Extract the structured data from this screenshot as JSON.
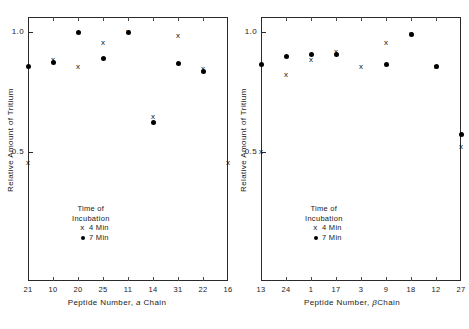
{
  "chart_data": [
    {
      "type": "scatter",
      "title": "",
      "panel_id": "alpha",
      "xlabel": "Peptide Number, a Chain",
      "xlabel_parts": {
        "prefix": "Peptide  Number, ",
        "italic": "a",
        "suffix": " Chain"
      },
      "ylabel": "Relative Amount of Tritium",
      "categories": [
        "21",
        "10",
        "20",
        "25",
        "11",
        "14",
        "31",
        "22",
        "16"
      ],
      "ylim": [
        0.44,
        1.04
      ],
      "yticks": [
        1.0,
        0.5
      ],
      "ytick_labels": [
        "1.0",
        "0.5"
      ],
      "grid": false,
      "legend_position": "lower-center",
      "series": [
        {
          "name": "4 Min",
          "marker": "x",
          "values": [
            0.455,
            0.885,
            0.855,
            0.955,
            1.0,
            0.645,
            0.985,
            0.845,
            0.455
          ]
        },
        {
          "name": "7 Min",
          "marker": "dot",
          "values": [
            0.855,
            0.875,
            1.0,
            0.89,
            1.0,
            0.625,
            0.87,
            0.835,
            null
          ]
        }
      ]
    },
    {
      "type": "scatter",
      "title": "",
      "panel_id": "beta",
      "xlabel": "Peptide Number, β Chain",
      "xlabel_parts": {
        "prefix": "Peptide  Number, ",
        "italic": "β",
        "suffix": "Chain"
      },
      "ylabel": "Relative Amount of Tritium",
      "categories": [
        "13",
        "24",
        "1",
        "17",
        "3",
        "9",
        "18",
        "12",
        "27"
      ],
      "ylim": [
        0.44,
        1.04
      ],
      "yticks": [
        1.0,
        0.5
      ],
      "ytick_labels": [
        "1.0",
        "0.5"
      ],
      "grid": false,
      "legend_position": "lower-center",
      "series": [
        {
          "name": "4 Min",
          "marker": "x",
          "values": [
            0.5,
            0.82,
            0.885,
            0.915,
            0.855,
            0.955,
            0.99,
            0.855,
            0.52
          ]
        },
        {
          "name": "7 Min",
          "marker": "dot",
          "values": [
            0.865,
            0.9,
            0.905,
            0.905,
            null,
            0.865,
            0.99,
            0.855,
            0.575
          ]
        }
      ]
    }
  ],
  "panels": {
    "alpha": {
      "legend": {
        "title_line1": "Time of",
        "title_line2": "Incubation",
        "entries": [
          {
            "symbol": "x",
            "label": "4 Min"
          },
          {
            "symbol": "dot",
            "label": "7 Min"
          }
        ]
      }
    },
    "beta": {
      "legend": {
        "title_line1": "Time of",
        "title_line2": "Incubation",
        "entries": [
          {
            "symbol": "x",
            "label": "4 Min"
          },
          {
            "symbol": "dot",
            "label": "7 Min"
          }
        ]
      }
    }
  },
  "colors": {
    "axis": "#2a2a2a",
    "marker": "#000000",
    "background": "#ffffff"
  }
}
